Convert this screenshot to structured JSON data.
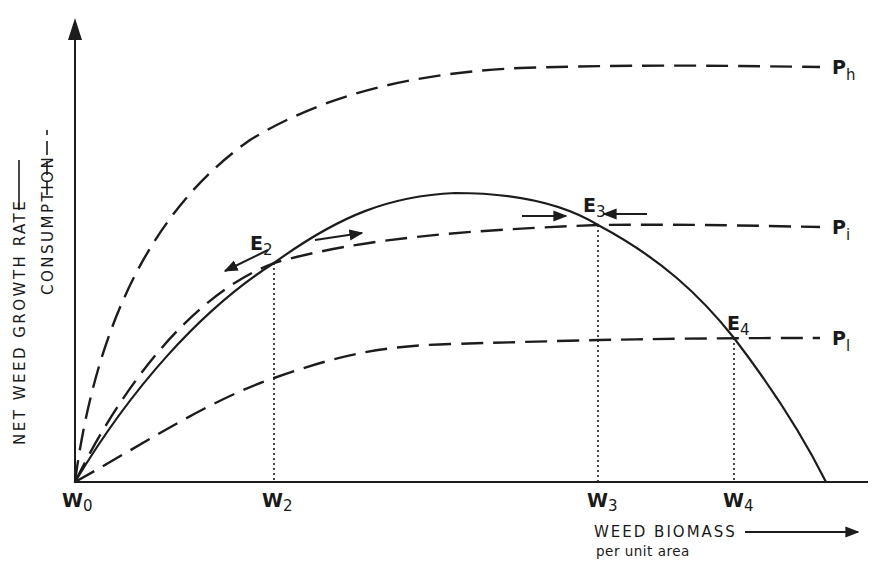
{
  "figure": {
    "y_axis_label": "NET WEED GROWTH RATE",
    "y_axis_label_2": "CONSUMPTION",
    "x_axis_label": "WEED BIOMASS",
    "x_axis_sublabel": "per unit area",
    "legend": {
      "growth_rate_style": "solid",
      "consumption_style": "dashed"
    },
    "curves": [
      {
        "id": "growth",
        "label": "Net weed growth rate",
        "style": "solid"
      },
      {
        "id": "Ph",
        "letter": "P",
        "subscript": "h",
        "style": "dashed"
      },
      {
        "id": "Pi",
        "letter": "P",
        "subscript": "i",
        "style": "dashed"
      },
      {
        "id": "Pl",
        "letter": "P",
        "subscript": "l",
        "style": "dashed"
      }
    ],
    "equilibria": [
      {
        "letter": "E",
        "subscript": "2",
        "stability": "unstable",
        "arrows": "outward"
      },
      {
        "letter": "E",
        "subscript": "3",
        "stability": "stable",
        "arrows": "inward"
      },
      {
        "letter": "E",
        "subscript": "4",
        "stability": "",
        "arrows": "none"
      }
    ],
    "x_ticks": [
      {
        "letter": "W",
        "subscript": "0"
      },
      {
        "letter": "W",
        "subscript": "2"
      },
      {
        "letter": "W",
        "subscript": "3"
      },
      {
        "letter": "W",
        "subscript": "4"
      }
    ],
    "colors": {
      "ink": "#1c1c1c",
      "background": "#ffffff"
    }
  }
}
